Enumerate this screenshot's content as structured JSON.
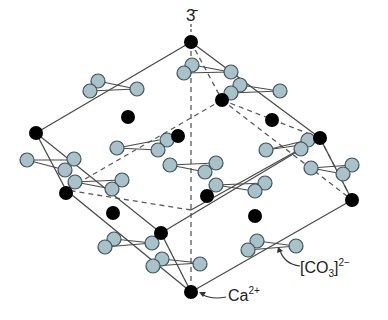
{
  "diagram": {
    "axis_label": "3̄",
    "labels": {
      "calcium": "Ca",
      "calcium_charge": "2+",
      "carbonate_open": "[CO",
      "carbonate_sub": "3",
      "carbonate_close": "]",
      "carbonate_charge": "2−"
    },
    "colors": {
      "calcium_atom": "#000000",
      "oxygen_atom_fill": "#a9c1c9",
      "oxygen_atom_stroke": "#3f5359",
      "edge_line": "#4a4a4a",
      "background": "#ffffff"
    },
    "atom_types": [
      "Ca2+ (black sphere)",
      "CO3 2- group (three light-blue oxygen spheres around central carbon)"
    ]
  }
}
